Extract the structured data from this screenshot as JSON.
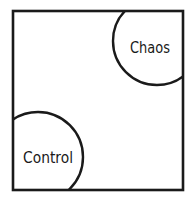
{
  "diagram": {
    "frame": {
      "x": 13,
      "y": 11,
      "width": 170,
      "height": 179,
      "stroke": "#1a1a1a"
    },
    "regions": [
      {
        "label": "Chaos",
        "position": "top-right",
        "cx": 157,
        "cy": 41,
        "r": 44
      },
      {
        "label": "Control",
        "position": "bottom-left",
        "cx": 38,
        "cy": 157,
        "r": 45
      }
    ]
  }
}
